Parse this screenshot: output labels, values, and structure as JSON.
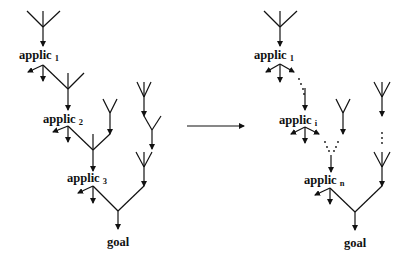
{
  "diagram": {
    "type": "proof-tree transformation",
    "left_tree": {
      "labels": [
        {
          "base": "applic",
          "sub": "1"
        },
        {
          "base": "applic",
          "sub": "2"
        },
        {
          "base": "applic",
          "sub": "3"
        }
      ],
      "root": "goal"
    },
    "right_tree": {
      "labels": [
        {
          "base": "applic",
          "sub": "1"
        },
        {
          "base": "applic",
          "sub": "i"
        },
        {
          "base": "applic",
          "sub": "n"
        }
      ],
      "root": "goal",
      "ellipsis": "⋮"
    },
    "transform_arrow": "right-arrow"
  }
}
